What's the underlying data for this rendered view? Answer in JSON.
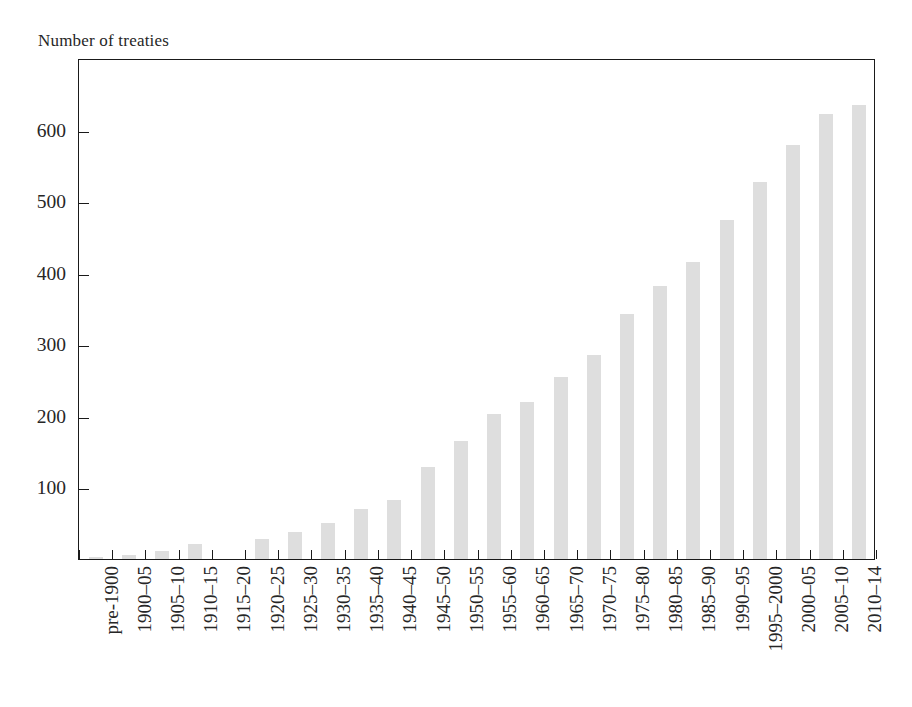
{
  "chart_data": {
    "type": "bar",
    "title": "",
    "ylabel": "Number of treaties",
    "xlabel": "",
    "ylim": [
      0,
      700
    ],
    "yticks": [
      100,
      200,
      300,
      400,
      500,
      600
    ],
    "ytick_labels": [
      "100",
      "200",
      "300",
      "400",
      "500",
      "600"
    ],
    "grid": false,
    "legend": false,
    "bar_color": "#dedede",
    "axis_color": "#1a1a1a",
    "categories": [
      "pre-1900",
      "1900–05",
      "1905–10",
      "1910–15",
      "1915–20",
      "1920–25",
      "1925–30",
      "1930–35",
      "1935–40",
      "1940–45",
      "1945–50",
      "1950–55",
      "1955–60",
      "1960–65",
      "1965–70",
      "1970–75",
      "1975–80",
      "1980–85",
      "1985–90",
      "1990–95",
      "1995–2000",
      "2000–05",
      "2005–10",
      "2010–14"
    ],
    "values": [
      3,
      5,
      11,
      21,
      0,
      28,
      38,
      50,
      70,
      82,
      128,
      165,
      203,
      220,
      254,
      285,
      343,
      381,
      415,
      473,
      527,
      578,
      622,
      634
    ]
  }
}
